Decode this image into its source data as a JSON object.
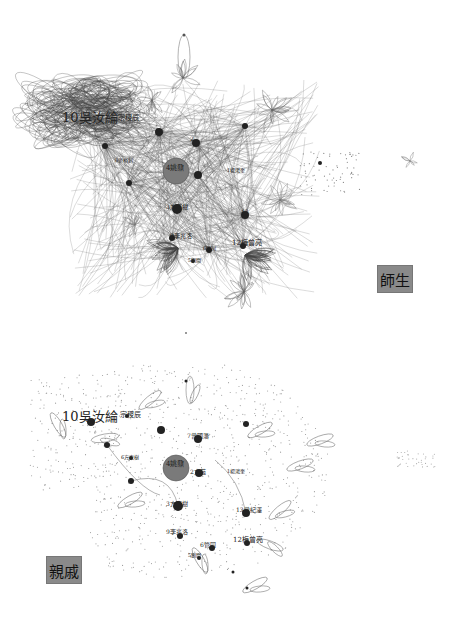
{
  "panels": [
    {
      "id": "top",
      "tag": "師生",
      "style": "edges",
      "hub": {
        "label": "4姚鼐",
        "x": 176,
        "y": 171,
        "r": 13
      },
      "labels": [
        {
          "text": "10吳汝綸",
          "x": 62,
          "y": 117,
          "size": 13
        },
        {
          "text": "宗稷辰",
          "x": 118,
          "y": 118,
          "size": 7
        },
        {
          "text": "4姚鼐",
          "x": 166,
          "y": 168,
          "size": 7
        },
        {
          "text": "2",
          "x": 190,
          "y": 139,
          "size": 6
        },
        {
          "text": "1楊鴻奎",
          "x": 227,
          "y": 170,
          "size": 5
        },
        {
          "text": "3方東樹",
          "x": 166,
          "y": 207,
          "size": 6
        },
        {
          "text": "13",
          "x": 241,
          "y": 212,
          "size": 6
        },
        {
          "text": "9李兆洛",
          "x": 170,
          "y": 236,
          "size": 6
        },
        {
          "text": "12梅曾亮",
          "x": 232,
          "y": 243,
          "size": 7
        },
        {
          "text": "6管同",
          "x": 203,
          "y": 248,
          "size": 5
        },
        {
          "text": "5劉開",
          "x": 188,
          "y": 260,
          "size": 5
        },
        {
          "text": "8張裕釗",
          "x": 115,
          "y": 160,
          "size": 5
        }
      ],
      "nodes": [
        {
          "x": 105,
          "y": 146,
          "r": 3
        },
        {
          "x": 159,
          "y": 132,
          "r": 4
        },
        {
          "x": 196,
          "y": 143,
          "r": 4
        },
        {
          "x": 198,
          "y": 175,
          "r": 4
        },
        {
          "x": 129,
          "y": 183,
          "r": 3
        },
        {
          "x": 177,
          "y": 209,
          "r": 5
        },
        {
          "x": 245,
          "y": 215,
          "r": 4
        },
        {
          "x": 209,
          "y": 250,
          "r": 3
        },
        {
          "x": 245,
          "y": 126,
          "r": 3
        },
        {
          "x": 172,
          "y": 238,
          "r": 3
        },
        {
          "x": 243,
          "y": 246,
          "r": 3
        },
        {
          "x": 193,
          "y": 261,
          "r": 2
        },
        {
          "x": 320,
          "y": 163,
          "r": 2
        }
      ]
    },
    {
      "id": "bottom",
      "tag": "親戚",
      "style": "dots",
      "hub": {
        "label": "4姚鼐",
        "x": 176,
        "y": 148,
        "r": 13
      },
      "labels": [
        {
          "text": "10吳汝綸",
          "x": 62,
          "y": 96,
          "size": 13
        },
        {
          "text": "宗稷辰",
          "x": 120,
          "y": 95,
          "size": 7
        },
        {
          "text": "7曾國藩",
          "x": 187,
          "y": 116,
          "size": 6
        },
        {
          "text": "4姚鼐",
          "x": 166,
          "y": 144,
          "size": 7
        },
        {
          "text": "2方苞",
          "x": 190,
          "y": 152,
          "size": 6
        },
        {
          "text": "1楊鴻奎",
          "x": 227,
          "y": 151,
          "size": 5
        },
        {
          "text": "6方東樹",
          "x": 121,
          "y": 137,
          "size": 5
        },
        {
          "text": "3方東樹",
          "x": 166,
          "y": 184,
          "size": 6
        },
        {
          "text": "13曾紀澤",
          "x": 236,
          "y": 190,
          "size": 6
        },
        {
          "text": "9李兆洛",
          "x": 166,
          "y": 212,
          "size": 6
        },
        {
          "text": "12梅曾亮",
          "x": 233,
          "y": 220,
          "size": 7
        },
        {
          "text": "6管同",
          "x": 200,
          "y": 225,
          "size": 6
        },
        {
          "text": "5劉開",
          "x": 188,
          "y": 235,
          "size": 5
        }
      ],
      "nodes": [
        {
          "x": 91,
          "y": 102,
          "r": 4
        },
        {
          "x": 127,
          "y": 96,
          "r": 2
        },
        {
          "x": 161,
          "y": 110,
          "r": 4
        },
        {
          "x": 198,
          "y": 119,
          "r": 4
        },
        {
          "x": 246,
          "y": 104,
          "r": 3
        },
        {
          "x": 107,
          "y": 125,
          "r": 3
        },
        {
          "x": 131,
          "y": 138,
          "r": 2
        },
        {
          "x": 199,
          "y": 153,
          "r": 4
        },
        {
          "x": 131,
          "y": 161,
          "r": 3
        },
        {
          "x": 178,
          "y": 186,
          "r": 5
        },
        {
          "x": 246,
          "y": 193,
          "r": 4
        },
        {
          "x": 180,
          "y": 216,
          "r": 3
        },
        {
          "x": 212,
          "y": 228,
          "r": 3
        },
        {
          "x": 247,
          "y": 223,
          "r": 3
        },
        {
          "x": 199,
          "y": 238,
          "r": 2
        },
        {
          "x": 233,
          "y": 252,
          "r": 1.5
        },
        {
          "x": 247,
          "y": 268,
          "r": 1.5
        },
        {
          "x": 186,
          "y": 61,
          "r": 1.5
        }
      ]
    }
  ]
}
